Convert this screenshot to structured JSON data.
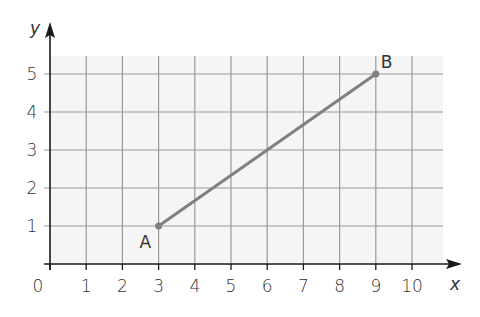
{
  "chart_data": {
    "type": "line",
    "title": "",
    "xlabel": "x",
    "ylabel": "y",
    "xlim": [
      0,
      10
    ],
    "ylim": [
      0,
      5
    ],
    "x_ticks": [
      "0",
      "1",
      "2",
      "3",
      "4",
      "5",
      "6",
      "7",
      "8",
      "9",
      "10"
    ],
    "y_ticks": [
      "1",
      "2",
      "3",
      "4",
      "5"
    ],
    "grid": true,
    "series": [
      {
        "name": "AB",
        "points": [
          {
            "label": "A",
            "x": 3,
            "y": 1
          },
          {
            "label": "B",
            "x": 9,
            "y": 5
          }
        ]
      }
    ]
  },
  "colors": {
    "grid_background": "#f5f5f5",
    "grid_line": "#9a9a9a",
    "axis": "#1a1a1a",
    "segment": "#808080"
  }
}
